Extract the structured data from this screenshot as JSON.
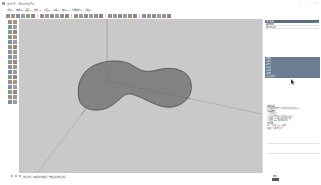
{
  "window": {
    "title": "无标题 - SketchUp Pro",
    "controls": [
      "minimize",
      "maximize",
      "close"
    ]
  },
  "menubar": {
    "items": [
      "文件(F)",
      "编辑(E)",
      "视图(V)",
      "相机(C)",
      "绘图(R)",
      "工具(T)",
      "窗口(W)",
      "扩展程序(x)",
      "帮助(H)"
    ]
  },
  "toolbar_top": {
    "icons": [
      "select-icon",
      "eraser-icon",
      "line-icon",
      "arc-icon",
      "rectangle-icon",
      "circle-icon",
      "polygon-icon",
      "freehand-icon",
      "move-icon",
      "rotate-icon",
      "scale-icon",
      "push-pull-icon",
      "follow-me-icon",
      "offset-icon",
      "tape-measure-icon",
      "protractor-icon",
      "dimension-icon",
      "text-icon",
      "axes-icon",
      "3d-text-icon",
      "paint-bucket-icon",
      "orbit-icon",
      "pan-icon",
      "zoom-icon",
      "zoom-extents-icon",
      "previous-view-icon",
      "warehouse-icon",
      "extension-warehouse-icon",
      "layout-icon",
      "extension-manager-icon"
    ]
  },
  "toolbar_left": {
    "icons": [
      "select-icon",
      "make-component-icon",
      "eraser-icon",
      "paint-bucket-icon",
      "line-icon",
      "freehand-icon",
      "rectangle-icon",
      "rotated-rectangle-icon",
      "circle-icon",
      "polygon-icon",
      "arc-icon",
      "pie-icon",
      "move-icon",
      "push-pull-icon",
      "rotate-icon",
      "follow-me-icon",
      "scale-icon",
      "offset-icon",
      "tape-measure-icon",
      "dimension-icon",
      "protractor-icon",
      "text-icon",
      "axes-icon",
      "3d-text-icon",
      "orbit-icon",
      "pan-icon",
      "zoom-icon",
      "zoom-window-icon",
      "zoom-extents-icon",
      "previous-icon",
      "position-camera-icon",
      "look-around-icon",
      "walk-icon",
      "section-plane-icon"
    ]
  },
  "viewport": {
    "background": "#c9c9c9",
    "shape_fill": "#808080",
    "shape_stroke": "#3c3c3c",
    "axis_colors": {
      "red": "#a8a8a8",
      "green": "#9aa89a",
      "blue": "#9a9aa8"
    }
  },
  "tray": {
    "header": {
      "title": "默认面板",
      "controls": "▾ ✕"
    },
    "sub_title": "图元信息",
    "sub_title2": "未选择图元",
    "sections": [
      {
        "label": "▸ 材料",
        "marker": ""
      },
      {
        "label": "▸ 组件",
        "marker": ""
      },
      {
        "label": "▸ 样式",
        "marker": ""
      },
      {
        "label": "▸ 标记",
        "marker": ""
      },
      {
        "label": "▸ 场景",
        "marker": ""
      },
      {
        "label": "▸ 阴影",
        "marker": ""
      },
      {
        "label": "▸ 柔化边线",
        "marker": ""
      }
    ],
    "instructor": {
      "heading": "选择工具",
      "description": "选择要用其他工具或命令修改的图元。",
      "ops_heading": "工具操作",
      "ops": [
        "1. 点击图元。",
        "2. 点击并拖动以选择多个图元。",
        "3. 按住 Ctrl 键添加到选择集。",
        "4. 按住 Shift 键切换选择。"
      ],
      "keys_heading": "修改键",
      "keys": "Ctrl = 添加, Shift = 切换",
      "link": "高级工具操作主题"
    },
    "measure_label": "数值"
  },
  "statusbar": {
    "text": "选择对象。切换到扩充选择。拖动鼠标选择多项。",
    "measure_label": "数值"
  }
}
